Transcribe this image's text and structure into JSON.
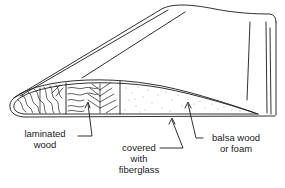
{
  "figure": {
    "line_color": "#1a1a1a",
    "background": "#ffffff"
  },
  "labels": {
    "laminated": {
      "line1": "laminated",
      "line2": "wood"
    },
    "covered": {
      "line1": "covered",
      "line2": "with",
      "line3": "fiberglass"
    },
    "balsa": {
      "line1": "balsa wood",
      "line2": "or foam"
    }
  }
}
